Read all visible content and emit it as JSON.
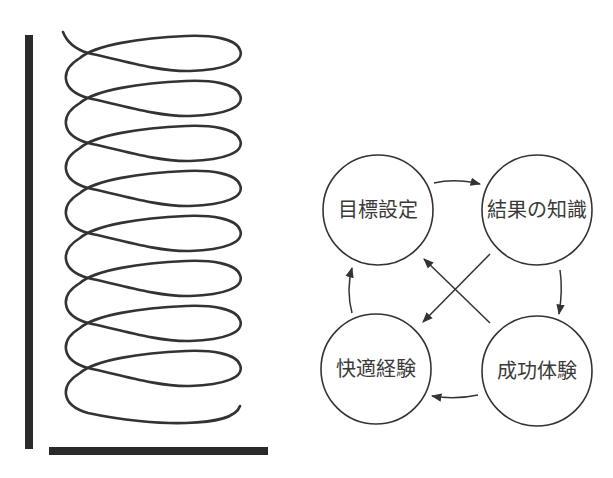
{
  "diagram": {
    "nodes": [
      {
        "id": "goal",
        "label": "目標設定"
      },
      {
        "id": "knowledge",
        "label": "結果の知識"
      },
      {
        "id": "success",
        "label": "成功体験"
      },
      {
        "id": "comfort",
        "label": "快適経験"
      }
    ],
    "edges": [
      {
        "from": "目標設定",
        "to": "結果の知識"
      },
      {
        "from": "結果の知識",
        "to": "成功体験"
      },
      {
        "from": "成功体験",
        "to": "快適経験"
      },
      {
        "from": "快適経験",
        "to": "目標設定"
      },
      {
        "from": "結果の知識",
        "to": "快適経験"
      },
      {
        "from": "成功体験",
        "to": "目標設定"
      }
    ],
    "spiral": {
      "loops": 8,
      "description": "upward spiral with vertical and horizontal axis bars"
    },
    "colors": {
      "stroke": "#333333",
      "bar": "#2a2a2a",
      "text": "#3a3a3a"
    }
  }
}
